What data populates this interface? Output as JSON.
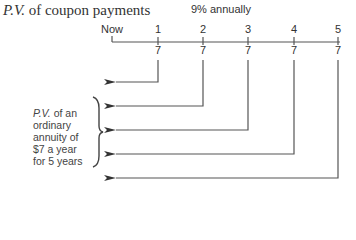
{
  "title": {
    "prefix_italic": "P.V.",
    "text": " of coupon payments"
  },
  "rate": "9% annually",
  "timeline": {
    "ticks": [
      {
        "label": "Now",
        "x": 112
      },
      {
        "label": "1",
        "x": 158
      },
      {
        "label": "2",
        "x": 203
      },
      {
        "label": "3",
        "x": 248
      },
      {
        "label": "4",
        "x": 294
      },
      {
        "label": "5",
        "x": 338
      }
    ],
    "payments": [
      "7",
      "7",
      "7",
      "7",
      "7"
    ]
  },
  "side_label": {
    "line1_italic": "P.V.",
    "line1_rest": " of an",
    "line2": "ordinary",
    "line3": "annuity of",
    "line4": "$7 a year",
    "line5": "for 5 years"
  }
}
